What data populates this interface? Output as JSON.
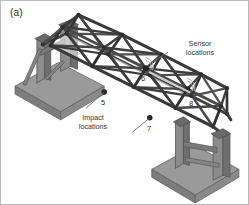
{
  "figure": {
    "panel_label": "(a)",
    "type": "3d-isometric-truss-bridge-diagram",
    "background_color": "#ffffff",
    "border_color": "#b9b9b9"
  },
  "annotations": [
    {
      "id": "sensor",
      "text": "Sensor\nlocations",
      "color": "#333333"
    },
    {
      "id": "impact",
      "text": "Impact\nlocations",
      "color": "#333333"
    }
  ],
  "node_labels": [
    {
      "id": "n5",
      "text": "5",
      "role": "impact-location"
    },
    {
      "id": "n6",
      "text": "6",
      "role": "sensor-location"
    },
    {
      "id": "n7",
      "text": "7",
      "role": "impact-location"
    },
    {
      "id": "n8",
      "text": "8",
      "role": "sensor-location"
    }
  ],
  "colors": {
    "member_dark": "#3a3a3a",
    "member_mid": "#585858",
    "joint": "#2e2e2e",
    "support_column": "#8c8c8c",
    "support_column_shade": "#6f6f6f",
    "support_pad": "#9a9a9a",
    "support_pad_shade": "#7d7d7d",
    "leader_line": "#6b6b6b",
    "sensor_arc": "#a8a8a8"
  }
}
